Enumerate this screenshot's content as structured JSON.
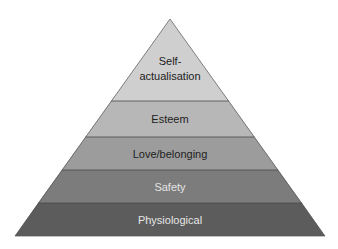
{
  "diagram": {
    "type": "pyramid",
    "levels": [
      {
        "label_line1": "Self-",
        "label_line2": "actualisation",
        "fill": "#cfcfcf",
        "text_color": "#222222"
      },
      {
        "label": "Esteem",
        "fill": "#b7b7b7",
        "text_color": "#222222"
      },
      {
        "label": "Love/belonging",
        "fill": "#9c9c9c",
        "text_color": "#1e1e1e"
      },
      {
        "label": "Safety",
        "fill": "#7c7c7c",
        "text_color": "#e4e4e4"
      },
      {
        "label": "Physiological",
        "fill": "#5c5c5c",
        "text_color": "#e6e6e6"
      }
    ],
    "divider_color": "#4a4a4a",
    "outline_color": "#555555"
  }
}
